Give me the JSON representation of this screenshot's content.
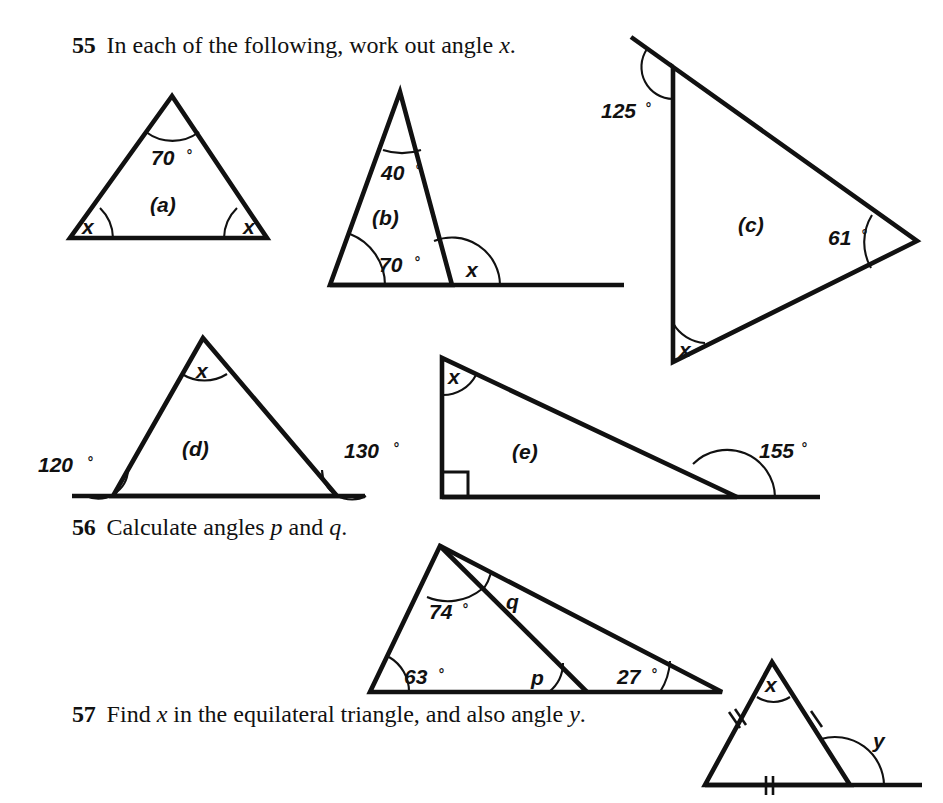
{
  "page": {
    "width": 943,
    "height": 803,
    "background": "#ffffff",
    "ink_color": "#111111"
  },
  "questions": [
    {
      "number": "55",
      "text_before": "In each of the following, work out angle ",
      "italic_var": "x",
      "text_after": "."
    },
    {
      "number": "56",
      "text_before": "Calculate angles ",
      "italic_var": "p",
      "text_mid": " and ",
      "italic_var2": "q",
      "text_after": "."
    },
    {
      "number": "57",
      "text_before": "Find ",
      "italic_var": "x",
      "text_mid": " in the equilateral triangle, and also angle ",
      "italic_var2": "y",
      "text_after": "."
    }
  ],
  "figures": [
    {
      "id": "a",
      "part_label": "(a)",
      "description": "isosceles triangle, apex angle labelled, two equal base angles labelled x",
      "labels": [
        {
          "name": "apex-angle",
          "value": "70",
          "unit": "°"
        },
        {
          "name": "base-left-angle",
          "value": "x"
        },
        {
          "name": "base-right-angle",
          "value": "x"
        }
      ]
    },
    {
      "id": "b",
      "part_label": "(b)",
      "description": "triangle on an extended base line, exterior angle x at right base vertex",
      "labels": [
        {
          "name": "apex-angle",
          "value": "40",
          "unit": "°"
        },
        {
          "name": "base-left-angle",
          "value": "70",
          "unit": "°"
        },
        {
          "name": "exterior-angle",
          "value": "x"
        }
      ]
    },
    {
      "id": "c",
      "part_label": "(c)",
      "description": "triangle with vertical left side, a ray extends beyond the top vertex, exterior angle 125 degrees",
      "labels": [
        {
          "name": "exterior-top-angle",
          "value": "125",
          "unit": "°"
        },
        {
          "name": "right-vertex-angle",
          "value": "61",
          "unit": "°"
        },
        {
          "name": "bottom-vertex-angle",
          "value": "x"
        }
      ]
    },
    {
      "id": "d",
      "part_label": "(d)",
      "description": "triangle on an extended base line with two exterior base angles given",
      "labels": [
        {
          "name": "exterior-left-angle",
          "value": "120",
          "unit": "°"
        },
        {
          "name": "exterior-right-angle",
          "value": "130",
          "unit": "°"
        },
        {
          "name": "apex-angle",
          "value": "x"
        }
      ]
    },
    {
      "id": "e",
      "part_label": "(e)",
      "description": "right-angled triangle on an extended base line, exterior angle 155 degrees",
      "labels": [
        {
          "name": "top-angle",
          "value": "x"
        },
        {
          "name": "exterior-angle",
          "value": "155",
          "unit": "°"
        }
      ]
    },
    {
      "id": "q56",
      "part_label": "",
      "description": "triangle split by a cevian from the apex, giving angles p and q",
      "labels": [
        {
          "name": "upper-left-angle",
          "value": "74",
          "unit": "°"
        },
        {
          "name": "angle-q",
          "value": "q"
        },
        {
          "name": "bottom-left-angle",
          "value": "63",
          "unit": "°"
        },
        {
          "name": "angle-p",
          "value": "p"
        },
        {
          "name": "bottom-right-angle",
          "value": "27",
          "unit": "°"
        }
      ]
    },
    {
      "id": "q57",
      "part_label": "",
      "description": "equilateral triangle with double tick marks on each side, base extended to form exterior angle y",
      "labels": [
        {
          "name": "apex-angle",
          "value": "x"
        },
        {
          "name": "exterior-angle",
          "value": "y"
        }
      ]
    }
  ]
}
